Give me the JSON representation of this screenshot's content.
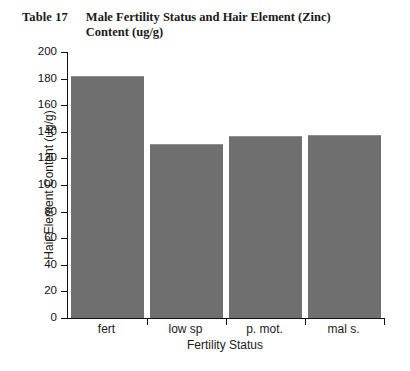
{
  "caption": {
    "label": "Table 17",
    "title": "Male Fertility Status and Hair Element (Zinc) Content (ug/g)"
  },
  "colors": {
    "bar_fill": "#6f6f6f",
    "axis": "#111111",
    "background": "#ffffff",
    "text": "#1a1a1a"
  },
  "chart_data": {
    "type": "bar",
    "title": "Male Fertility Status and Hair Element (Zinc) Content (ug/g)",
    "categories": [
      "fert",
      "low sp",
      "p. mot.",
      "mal s."
    ],
    "values": [
      181,
      130,
      136,
      137
    ],
    "xlabel": "Fertility Status",
    "ylabel": "Hair Element Content (ug/g)",
    "ylim": [
      0,
      200
    ],
    "ytick_labels": [
      "0",
      "20",
      "40",
      "60",
      "80",
      "100",
      "120",
      "140",
      "160",
      "180",
      "200"
    ],
    "ytick_values": [
      0,
      20,
      40,
      60,
      80,
      100,
      120,
      140,
      160,
      180,
      200
    ],
    "grid": false,
    "legend": null,
    "series": [
      {
        "name": "Hair Zinc Content",
        "values": [
          181,
          130,
          136,
          137
        ]
      }
    ]
  }
}
